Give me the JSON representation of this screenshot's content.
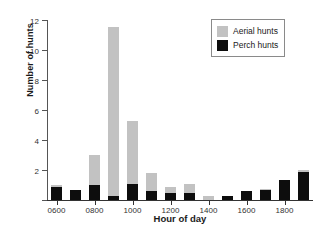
{
  "chart_data": {
    "type": "bar",
    "title": "",
    "xlabel": "Hour of day",
    "ylabel": "Number of hunts",
    "stacked": true,
    "grid": false,
    "legend_position": "top-right",
    "ylim": [
      0,
      12
    ],
    "yticks": [
      0,
      2,
      4,
      6,
      8,
      10,
      12
    ],
    "ytick_labels": [
      "",
      "2",
      "4",
      "6",
      "8",
      "10",
      "12"
    ],
    "xtick_labels": [
      "0600",
      "0800",
      "1000",
      "1200",
      "1400",
      "1600",
      "1800"
    ],
    "categories": [
      "0600",
      "0700",
      "0800",
      "0900",
      "1000",
      "1100",
      "1200",
      "1300",
      "1400",
      "1500",
      "1600",
      "1700",
      "1800",
      "1900"
    ],
    "series": [
      {
        "name": "Perch hunts",
        "color": "#0d0d0d",
        "values": [
          0.85,
          0.7,
          1.0,
          0.3,
          1.1,
          0.6,
          0.5,
          0.5,
          0.0,
          0.3,
          0.6,
          0.7,
          1.35,
          1.85
        ]
      },
      {
        "name": "Aerial hunts",
        "color": "#c2c2c2",
        "values": [
          0.15,
          0.0,
          2.0,
          11.25,
          4.15,
          1.2,
          0.35,
          0.55,
          0.3,
          0.0,
          0.0,
          0.05,
          0.0,
          0.15
        ]
      }
    ],
    "totals": [
      1.0,
      0.7,
      3.0,
      11.55,
      5.25,
      1.8,
      0.85,
      1.05,
      0.3,
      0.3,
      0.6,
      0.75,
      1.35,
      2.0
    ]
  },
  "legend": {
    "entries": [
      {
        "label": "Aerial hunts",
        "color": "#c2c2c2"
      },
      {
        "label": "Perch hunts",
        "color": "#0d0d0d"
      }
    ]
  }
}
